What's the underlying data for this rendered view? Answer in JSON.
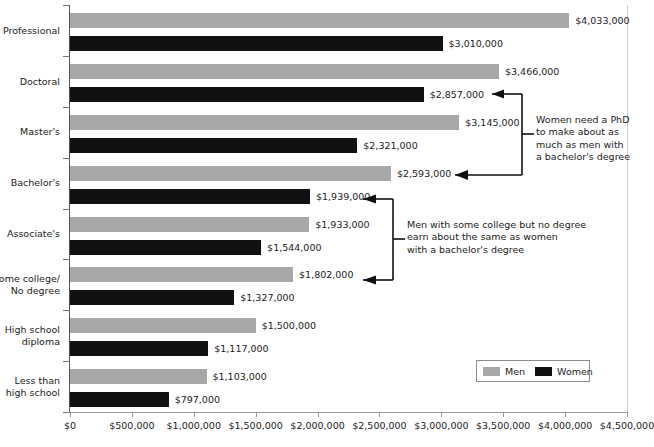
{
  "chart_data": {
    "type": "bar",
    "orientation": "horizontal",
    "title": "",
    "subtitle": "",
    "xlabel": "",
    "ylabel": "",
    "xlim": [
      0,
      4500000
    ],
    "xticks": [
      0,
      500000,
      1000000,
      1500000,
      2000000,
      2500000,
      3000000,
      3500000,
      4000000,
      4500000
    ],
    "xticklabels": [
      "$0",
      "$500,000",
      "$1,000,000",
      "$1,500,000",
      "$2,000,000",
      "$2,500,000",
      "$3,000,000",
      "$3,500,000",
      "$4,000,000",
      "$4,500,000"
    ],
    "grid": false,
    "legend_position": "lower right",
    "categories": [
      "Professional",
      "Doctoral",
      "Master's",
      "Bachelor's",
      "Associate's",
      "Some college/\nNo degree",
      "High school\ndiploma",
      "Less than\nhigh school"
    ],
    "series": [
      {
        "name": "Men",
        "color": "#a8a8a8",
        "values": [
          4033000,
          3466000,
          3145000,
          2593000,
          1933000,
          1802000,
          1500000,
          1103000
        ],
        "labels": [
          "$4,033,000",
          "$3,466,000",
          "$3,145,000",
          "$2,593,000",
          "$1,933,000",
          "$1,802,000",
          "$1,500,000",
          "$1,103,000"
        ]
      },
      {
        "name": "Women",
        "color": "#111111",
        "values": [
          3010000,
          2857000,
          2321000,
          1939000,
          1544000,
          1327000,
          1117000,
          797000
        ],
        "labels": [
          "$3,010,000",
          "$2,857,000",
          "$2,321,000",
          "$1,939,000",
          "$1,544,000",
          "$1,327,000",
          "$1,117,000",
          "$797,000"
        ]
      }
    ],
    "annotations": [
      {
        "id": "phd-note",
        "text": "Women need a PhD\nto make about as\nmuch as men with\na bachelor's degree",
        "points_to": [
          "$2,857,000",
          "$2,593,000"
        ]
      },
      {
        "id": "some-college-note",
        "text": "Men with some college but no degree\nearn about the same as women\nwith a bachelor's degree",
        "points_to": [
          "$1,939,000",
          "$1,802,000"
        ]
      }
    ]
  },
  "legend": {
    "men_label": "Men",
    "women_label": "Women"
  }
}
